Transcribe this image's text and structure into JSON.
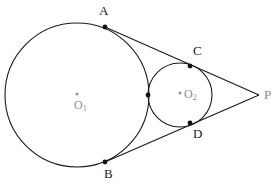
{
  "figure": {
    "width": 272,
    "height": 183,
    "background": "#ffffff",
    "stroke_color": "#1a1a1a",
    "label_color": "#1a1a1a",
    "center_label_color": "#8c8c8c",
    "stroke_width": 1.1
  },
  "circles": [
    {
      "name": "circle-o1",
      "center_label": "O",
      "center_subscript": "1",
      "cx": 77,
      "cy": 95,
      "r": 72,
      "center_dot_x": 77,
      "center_dot_y": 94
    },
    {
      "name": "circle-o2",
      "center_label": "O",
      "center_subscript": "2",
      "cx": 180,
      "cy": 95,
      "r": 32,
      "center_dot_x": 180,
      "center_dot_y": 93
    }
  ],
  "points": [
    {
      "id": "A",
      "label": "A",
      "x": 105,
      "y": 27,
      "label_x": 99,
      "label_y": 4,
      "dot": true
    },
    {
      "id": "B",
      "label": "B",
      "x": 105,
      "y": 162,
      "label_x": 104,
      "label_y": 167,
      "dot": true
    },
    {
      "id": "C",
      "label": "C",
      "x": 190,
      "y": 66,
      "label_x": 193,
      "label_y": 44,
      "dot": true
    },
    {
      "id": "D",
      "label": "D",
      "x": 190,
      "y": 123,
      "label_x": 193,
      "label_y": 127,
      "dot": true
    },
    {
      "id": "T",
      "label": "",
      "x": 148,
      "y": 95,
      "label_x": 0,
      "label_y": 0,
      "dot": true
    },
    {
      "id": "P",
      "label": "P",
      "x": 259,
      "y": 95,
      "label_x": 264,
      "label_y": 88,
      "dot": false
    }
  ],
  "lines": [
    {
      "name": "tangent-line-a-p",
      "x1": 105,
      "y1": 27,
      "x2": 259,
      "y2": 95
    },
    {
      "name": "tangent-line-b-p",
      "x1": 105,
      "y1": 162,
      "x2": 259,
      "y2": 95
    }
  ],
  "dot_radius": 2.4,
  "center_dot_radius": 1.6
}
